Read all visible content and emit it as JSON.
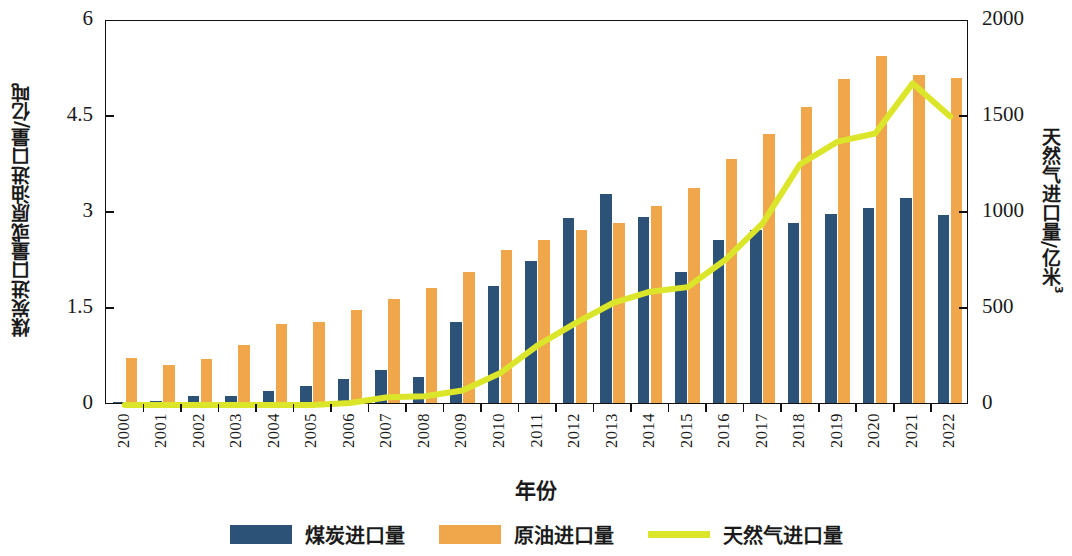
{
  "chart_data": {
    "type": "bar",
    "title": "",
    "xlabel": "年份",
    "ylabel_left": "煤炭进口量或原油进口量/亿吨",
    "ylabel_right": "天然气进口量/亿米³",
    "ylabel_right_base": "天然气进口量/亿米",
    "ylabel_right_sup": "3",
    "categories": [
      "2000",
      "2001",
      "2002",
      "2003",
      "2004",
      "2005",
      "2006",
      "2007",
      "2008",
      "2009",
      "2010",
      "2011",
      "2012",
      "2013",
      "2014",
      "2015",
      "2016",
      "2017",
      "2018",
      "2019",
      "2020",
      "2021",
      "2022"
    ],
    "ylim_left": [
      0,
      6
    ],
    "yticks_left": [
      "0",
      "1.5",
      "3",
      "4.5",
      "6"
    ],
    "ytick_values_left": [
      0,
      1.5,
      3,
      4.5,
      6
    ],
    "ylim_right": [
      0,
      2000
    ],
    "yticks_right": [
      "0",
      "500",
      "1000",
      "1500",
      "2000"
    ],
    "ytick_values_right": [
      0,
      500,
      1000,
      1500,
      2000
    ],
    "grid": false,
    "legend_position": "bottom",
    "series": [
      {
        "name": "煤炭进口量",
        "type": "bar",
        "axis": "left",
        "unit": "亿吨",
        "color": "#2d5278",
        "values": [
          0.02,
          0.03,
          0.11,
          0.11,
          0.18,
          0.26,
          0.38,
          0.51,
          0.4,
          1.26,
          1.83,
          2.22,
          2.89,
          3.27,
          2.91,
          2.04,
          2.55,
          2.71,
          2.81,
          2.96,
          3.04,
          3.2,
          2.93
        ]
      },
      {
        "name": "原油进口量",
        "type": "bar",
        "axis": "left",
        "unit": "亿吨",
        "color": "#f0a64a",
        "values": [
          0.7,
          0.6,
          0.69,
          0.91,
          1.23,
          1.27,
          1.45,
          1.63,
          1.79,
          2.04,
          2.39,
          2.54,
          2.71,
          2.82,
          3.08,
          3.36,
          3.81,
          4.2,
          4.62,
          5.06,
          5.42,
          5.13,
          5.08
        ]
      },
      {
        "name": "天然气进口量",
        "type": "line",
        "axis": "right",
        "unit": "亿米³",
        "color": "#dbe62b",
        "values": [
          0,
          0,
          0,
          0,
          0,
          0,
          10,
          40,
          46,
          76,
          165,
          310,
          425,
          530,
          590,
          614,
          755,
          946,
          1254,
          1372,
          1414,
          1675,
          1503
        ]
      }
    ]
  },
  "legend": {
    "items": [
      {
        "label": "煤炭进口量",
        "kind": "bar",
        "color": "#2d5278"
      },
      {
        "label": "原油进口量",
        "kind": "bar",
        "color": "#f0a64a"
      },
      {
        "label": "天然气进口量",
        "kind": "line",
        "color": "#dbe62b"
      }
    ]
  }
}
